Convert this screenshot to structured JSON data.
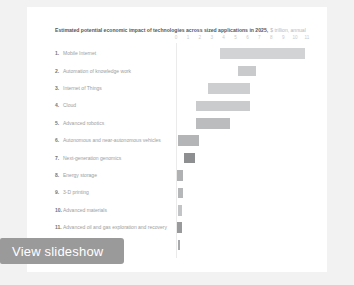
{
  "card": {
    "background": "#ffffff",
    "page_background": "#f2f2f2"
  },
  "overlay": {
    "view_slideshow_label": "View slideshow",
    "background": "#9a9a9a",
    "text_color": "#ffffff"
  },
  "chart_data": {
    "type": "bar",
    "orientation": "horizontal",
    "subtype": "range-bar",
    "title": "Estimated potential economic impact of technologies across sized applications in 2025,",
    "subtitle": "$ trillion, annual",
    "xlabel": "",
    "ylabel": "",
    "xlim": [
      0,
      11
    ],
    "grid": false,
    "legend": "none",
    "tick_labels": [
      "0",
      "1",
      "2",
      "3",
      "4",
      "5",
      "6",
      "7",
      "8",
      "9",
      "10",
      "11"
    ],
    "tick_values": [
      0,
      1,
      2,
      3,
      4,
      5,
      6,
      7,
      8,
      9,
      10,
      11
    ],
    "categories": [
      "Mobile Internet",
      "Automation of knowledge work",
      "Internet of Things",
      "Cloud",
      "Advanced robotics",
      "Autonomous and near-autonomous vehicles",
      "Next-generation genomics",
      "Energy storage",
      "3-D printing",
      "Advanced materials",
      "Advanced oil and gas exploration and recovery",
      "Renewable energy"
    ],
    "rows": [
      {
        "rank": "1.",
        "label": "Mobile Internet",
        "low": 3.7,
        "high": 10.8,
        "color": "#d2d3d4"
      },
      {
        "rank": "2.",
        "label": "Automation of knowledge work",
        "low": 5.2,
        "high": 6.7,
        "color": "#c9cacb"
      },
      {
        "rank": "3.",
        "label": "Internet of Things",
        "low": 2.7,
        "high": 6.2,
        "color": "#cdcecf"
      },
      {
        "rank": "4.",
        "label": "Cloud",
        "low": 1.7,
        "high": 6.2,
        "color": "#cacbcc"
      },
      {
        "rank": "5.",
        "label": "Advanced robotics",
        "low": 1.7,
        "high": 4.5,
        "color": "#bbbcbd"
      },
      {
        "rank": "6.",
        "label": "Autonomous and near-autonomous vehicles",
        "low": 0.2,
        "high": 1.9,
        "color": "#b4b5b6"
      },
      {
        "rank": "7.",
        "label": "Next-generation genomics",
        "low": 0.7,
        "high": 1.6,
        "color": "#8e8f90"
      },
      {
        "rank": "8.",
        "label": "Energy storage",
        "low": 0.1,
        "high": 0.6,
        "color": "#b0b1b2"
      },
      {
        "rank": "9.",
        "label": "3-D printing",
        "low": 0.2,
        "high": 0.6,
        "color": "#b6b7b8"
      },
      {
        "rank": "10.",
        "label": "Advanced materials",
        "low": 0.2,
        "high": 0.5,
        "color": "#c3c4c5"
      },
      {
        "rank": "11.",
        "label": "Advanced oil and gas exploration and recovery",
        "low": 0.1,
        "high": 0.5,
        "color": "#999a9b"
      },
      {
        "rank": "12.",
        "label": "Renewable energy",
        "low": 0.15,
        "high": 0.35,
        "color": "#a8a9aa"
      }
    ]
  }
}
